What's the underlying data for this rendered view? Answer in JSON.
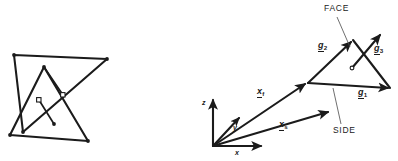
{
  "figure": {
    "background_color": "#ffffff",
    "ink_color": "#1b1b1b",
    "width": 398,
    "height": 161
  },
  "left_panel": {
    "name": "overlapping-triangles-sketch",
    "description": "Two overlapping triangles with interior short segments terminated by small open circles",
    "shapes": [
      {
        "name": "upper-triangle",
        "vertices": [
          [
            14,
            55
          ],
          [
            107,
            59
          ],
          [
            23,
            132
          ]
        ]
      },
      {
        "name": "lower-triangle",
        "vertices": [
          [
            44,
            67
          ],
          [
            88,
            141
          ],
          [
            10,
            135
          ]
        ]
      }
    ],
    "markers": [
      {
        "name": "normal-segment-1",
        "from": [
          44,
          67
        ],
        "to": [
          63,
          95
        ],
        "marker": "open-circle"
      },
      {
        "name": "normal-segment-2",
        "from": [
          54,
          124
        ],
        "to": [
          39,
          100
        ],
        "marker": "open-circle"
      }
    ],
    "vertex_dots": [
      [
        14,
        55
      ],
      [
        107,
        59
      ],
      [
        23,
        132
      ],
      [
        44,
        67
      ],
      [
        88,
        141
      ],
      [
        10,
        135
      ],
      [
        54,
        124
      ]
    ]
  },
  "right_panel": {
    "name": "vector-face-diagram",
    "axes": {
      "origin": [
        213,
        146
      ],
      "items": [
        {
          "label": "z",
          "name": "z-axis",
          "tip": [
            213,
            98
          ],
          "label_pos": [
            203,
            101
          ]
        },
        {
          "label": "y",
          "name": "y-axis",
          "tip": [
            240,
            117
          ],
          "label_pos": [
            234,
            127
          ]
        },
        {
          "label": "x",
          "name": "x-axis",
          "tip": [
            263,
            146
          ],
          "label_pos": [
            236,
            150
          ]
        }
      ]
    },
    "position_vectors": [
      {
        "name": "x-f-vector",
        "base": "x",
        "subscript": "f",
        "from": [
          213,
          146
        ],
        "to": [
          307,
          83
        ],
        "label_pos": [
          259,
          91
        ]
      },
      {
        "name": "x-s-vector",
        "base": "x",
        "subscript": "s",
        "from": [
          213,
          146
        ],
        "to": [
          330,
          111
        ],
        "label_pos": [
          281,
          124
        ]
      }
    ],
    "face_triangle": {
      "name": "face-triangle",
      "vertices": [
        [
          308,
          83
        ],
        [
          353,
          40
        ],
        [
          390,
          88
        ]
      ]
    },
    "edge_vectors": [
      {
        "name": "g1-vector",
        "base": "g",
        "subscript": "1",
        "from": [
          308,
          83
        ],
        "to": [
          390,
          88
        ],
        "label_pos": [
          360,
          92
        ]
      },
      {
        "name": "g2-vector",
        "base": "g",
        "subscript": "2",
        "from": [
          308,
          83
        ],
        "to": [
          353,
          40
        ],
        "label_pos": [
          320,
          45
        ]
      },
      {
        "name": "g3-vector",
        "base": "g",
        "subscript": "3",
        "from": [
          352,
          68
        ],
        "to": [
          382,
          33
        ],
        "label_pos": [
          376,
          48
        ]
      }
    ],
    "interior_point": {
      "name": "g3-origin-marker",
      "pos": [
        352,
        68
      ]
    },
    "callouts": [
      {
        "name": "face-callout",
        "label": "FACE",
        "label_pos": [
          325,
          5
        ],
        "leader_from": [
          337,
          16
        ],
        "leader_to": [
          350,
          46
        ]
      },
      {
        "name": "side-callout",
        "label": "SIDE",
        "label_pos": [
          334,
          128
        ],
        "leader_from": [
          342,
          126
        ],
        "leader_to": [
          334,
          88
        ]
      }
    ]
  }
}
